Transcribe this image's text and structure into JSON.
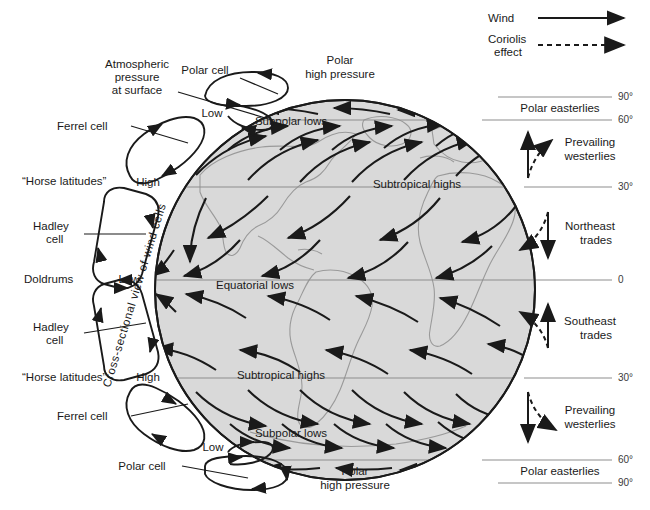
{
  "figure": {
    "background_color": "#ffffff",
    "globe_fill": "#d9d9d9",
    "globe_stroke": "#1a1a1a",
    "land_stroke": "#9a9a9a",
    "line_color": "#1a1a1a",
    "lat_line_color": "#8d8d8d"
  },
  "legend": {
    "items": [
      {
        "label": "Wind",
        "style": "solid-arrow"
      },
      {
        "label": "Coriolis effect",
        "label_line1": "Coriolis",
        "label_line2": "effect",
        "style": "dashed-arrow"
      }
    ]
  },
  "left_labels": {
    "atmospheric_pressure": {
      "line1": "Atmospheric",
      "line2": "pressure",
      "line3": "at surface"
    },
    "cross_section_caption": "Cross-sectional view of wind cells",
    "items": [
      {
        "name": "polar-cell-north",
        "label": "Polar cell"
      },
      {
        "name": "ferrel-cell-north",
        "label": "Ferrel cell"
      },
      {
        "name": "horse-latitudes-north",
        "label": "“Horse latitudes”"
      },
      {
        "name": "hadley-cell-north",
        "label_line1": "Hadley",
        "label_line2": "cell"
      },
      {
        "name": "doldrums",
        "label": "Doldrums"
      },
      {
        "name": "hadley-cell-south",
        "label_line1": "Hadley",
        "label_line2": "cell"
      },
      {
        "name": "horse-latitudes-south",
        "label": "“Horse latitudes”"
      },
      {
        "name": "ferrel-cell-south",
        "label": "Ferrel cell"
      },
      {
        "name": "polar-cell-south",
        "label": "Polar cell"
      }
    ]
  },
  "pressure_markers": [
    {
      "name": "low-polar-north",
      "label": "Low",
      "x": 212,
      "y": 117
    },
    {
      "name": "high-subtropical-north",
      "label": "High",
      "x": 148,
      "y": 186
    },
    {
      "name": "low-equatorial",
      "label": "Low",
      "x": 129,
      "y": 283
    },
    {
      "name": "high-subtropical-south",
      "label": "High",
      "x": 148,
      "y": 381
    },
    {
      "name": "low-polar-south",
      "label": "Low",
      "x": 213,
      "y": 451
    }
  ],
  "globe_labels": [
    {
      "name": "polar-high-pressure-north",
      "line1": "Polar",
      "line2": "high pressure",
      "x": 340,
      "y": 64
    },
    {
      "name": "subpolar-lows-north",
      "label": "Subpolar lows",
      "x": 291,
      "y": 125
    },
    {
      "name": "subtropical-highs-north",
      "label": "Subtropical highs",
      "x": 417,
      "y": 188
    },
    {
      "name": "equatorial-lows",
      "label": "Equatorial    lows",
      "x": 255,
      "y": 289
    },
    {
      "name": "subtropical-highs-south",
      "label": "Subtropical highs",
      "x": 281,
      "y": 379
    },
    {
      "name": "subpolar-lows-south",
      "label": "Subpolar lows",
      "x": 291,
      "y": 437
    },
    {
      "name": "polar-high-pressure-south",
      "line1": "Polar",
      "line2": "high pressure",
      "x": 355,
      "y": 475
    }
  ],
  "latitudes": [
    {
      "label": "90°",
      "y": 97
    },
    {
      "label": "60°",
      "y": 120
    },
    {
      "label": "30°",
      "y": 187
    },
    {
      "label": "0",
      "y": 280
    },
    {
      "label": "30°",
      "y": 378
    },
    {
      "label": "60°",
      "y": 460
    },
    {
      "label": "90°",
      "y": 483
    }
  ],
  "wind_belts": [
    {
      "name": "polar-easterlies-north",
      "label": "Polar easterlies",
      "x": 560,
      "y": 110,
      "lines": 1
    },
    {
      "name": "prevailing-westerlies-north",
      "line1": "Prevailing",
      "line2": "westerlies",
      "x": 585,
      "y": 146
    },
    {
      "name": "northeast-trades",
      "line1": "Northeast",
      "line2": "trades",
      "x": 585,
      "y": 230
    },
    {
      "name": "southeast-trades",
      "line1": "Southeast",
      "line2": "trades",
      "x": 585,
      "y": 325
    },
    {
      "name": "prevailing-westerlies-south",
      "line1": "Prevailing",
      "line2": "westerlies",
      "x": 585,
      "y": 414
    },
    {
      "name": "polar-easterlies-south",
      "label": "Polar easterlies",
      "x": 560,
      "y": 473,
      "lines": 1
    }
  ],
  "coriolis_pairs": [
    {
      "name": "coriolis-prevailing-westerlies-north",
      "wind_dir": "north",
      "deflect": "right"
    },
    {
      "name": "coriolis-northeast-trades",
      "wind_dir": "south",
      "deflect": "right"
    },
    {
      "name": "coriolis-southeast-trades",
      "wind_dir": "north",
      "deflect": "left"
    },
    {
      "name": "coriolis-prevailing-westerlies-south",
      "wind_dir": "south",
      "deflect": "left"
    }
  ]
}
